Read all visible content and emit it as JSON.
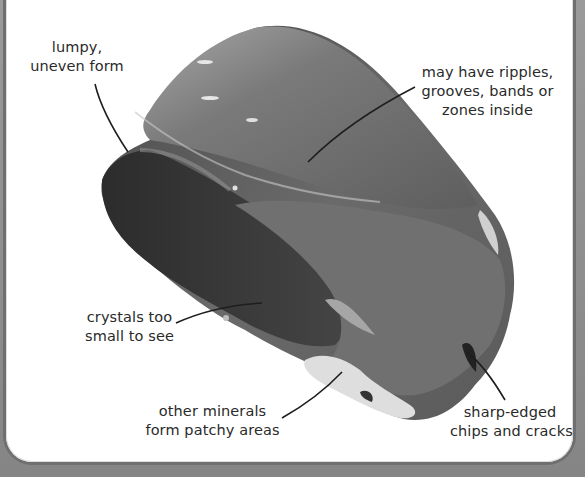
{
  "figure": {
    "top_caption_partial": "",
    "labels": [
      {
        "id": "lumpy",
        "lines": [
          "lumpy,",
          "uneven form"
        ]
      },
      {
        "id": "ripples",
        "lines": [
          "may have ripples,",
          "grooves, bands or",
          "zones inside"
        ]
      },
      {
        "id": "crystals",
        "lines": [
          "crystals too",
          "small to see"
        ]
      },
      {
        "id": "minerals",
        "lines": [
          "other minerals",
          "form patchy areas"
        ]
      },
      {
        "id": "chips",
        "lines": [
          "sharp-edged",
          "chips and cracks"
        ]
      }
    ]
  },
  "colors": {
    "frame": "#8c8c8c",
    "panel": "#ffffff",
    "rock_dark": "#3a3a3a",
    "rock_mid": "#6a6a6a",
    "rock_light": "#9a9a9a",
    "text": "#2a2a2a"
  }
}
